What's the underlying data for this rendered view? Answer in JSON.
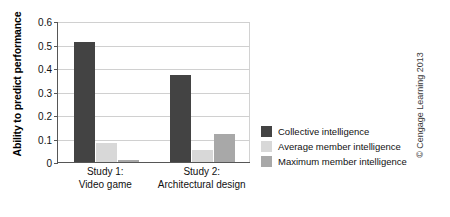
{
  "chart_data": {
    "type": "bar",
    "title": "",
    "xlabel": "",
    "ylabel": "Ability to predict performance",
    "ylim": [
      0,
      0.6
    ],
    "ytick_labels": [
      "0.6",
      "0.5",
      "0.4",
      "0.3",
      "0.2",
      "0.1",
      "0"
    ],
    "ytick_values": [
      0.6,
      0.5,
      0.4,
      0.3,
      0.2,
      0.1,
      0
    ],
    "grid": true,
    "legend_position": "right",
    "categories": [
      "Study 1:\nVideo game",
      "Study 2:\nArchitectural design"
    ],
    "category_lines": [
      [
        "Study 1:",
        "Video game"
      ],
      [
        "Study 2:",
        "Architectural design"
      ]
    ],
    "series": [
      {
        "name": "Collective intelligence",
        "color": "#434343",
        "values": [
          0.51,
          0.37
        ]
      },
      {
        "name": "Average member intelligence",
        "color": "#d8d8d8",
        "values": [
          0.08,
          0.05
        ]
      },
      {
        "name": "Maximum member intelligence",
        "color": "#a8a8a8",
        "values": [
          0.01,
          0.12
        ]
      }
    ]
  },
  "credit": "© Cengage Learning 2013"
}
